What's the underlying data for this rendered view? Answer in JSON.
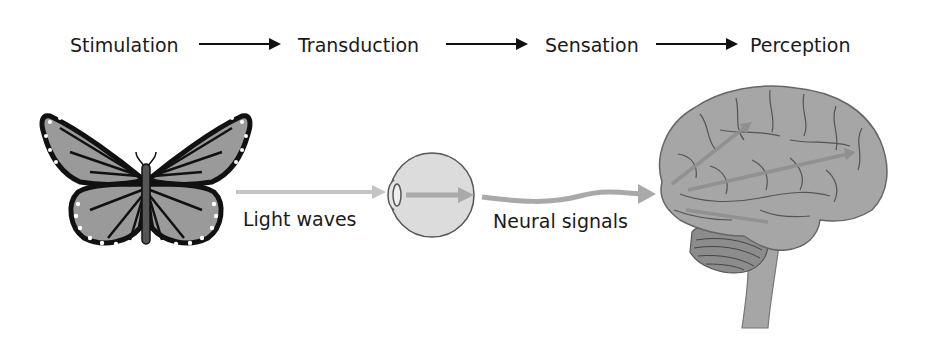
{
  "diagram": {
    "stages": [
      {
        "label": "Stimulation"
      },
      {
        "label": "Transduction"
      },
      {
        "label": "Sensation"
      },
      {
        "label": "Perception"
      }
    ],
    "captions": {
      "light": "Light waves",
      "neural": "Neural signals"
    },
    "illustrations": [
      "butterfly",
      "eye",
      "brain"
    ],
    "colors": {
      "text": "#1a1a1a",
      "arrow_black": "#111111",
      "signal_gray": "#a9a9a9",
      "light_gray": "#c4c4c4",
      "wing_fill": "#9a9a9a",
      "brain_fill": "#a6a6a6",
      "eye_fill": "#dcdcdc"
    }
  }
}
